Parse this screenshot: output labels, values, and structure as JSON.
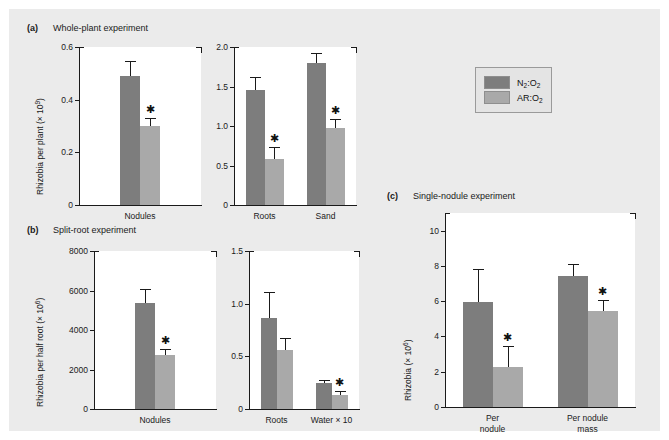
{
  "figure": {
    "background": "#ebebeb",
    "colors": {
      "dark": "#7d7d7d",
      "light": "#a9a9a9",
      "axis": "#1a1a1a"
    }
  },
  "legend": {
    "entries": [
      {
        "label_main": "N",
        "label_sub1": "2",
        "label_mid": ":O",
        "label_sub2": "2",
        "color": "#7d7d7d",
        "full": "N2:O2"
      },
      {
        "label_main": "AR",
        "label_sub1": "",
        "label_mid": ":O",
        "label_sub2": "2",
        "color": "#a9a9a9",
        "full": "AR:O2"
      }
    ]
  },
  "panels": [
    {
      "tag": "(a)",
      "title": "Whole-plant experiment",
      "ylabel_text": "Rhizobia per plant (× 10",
      "ylabel_exp": "9",
      "ylabel_close": ")"
    },
    {
      "tag": "(b)",
      "title": "Split-root experiment",
      "ylabel_text": "Rhizobia per half root (× 10",
      "ylabel_exp": "6",
      "ylabel_close": ")"
    },
    {
      "tag": "(c)",
      "title": "Single-nodule experiment",
      "ylabel_text": "Rhizobia (× 10",
      "ylabel_exp": "6",
      "ylabel_close": ")"
    }
  ],
  "chart_data": [
    {
      "id": "a-left",
      "type": "bar",
      "panel": "(a)",
      "title": "Whole-plant experiment",
      "ylabel": "Rhizobia per plant (× 10^9)",
      "xlabel": "",
      "ylim": [
        0,
        0.6
      ],
      "yticks": [
        0,
        0.2,
        0.4,
        0.6
      ],
      "yticklabels": [
        "0",
        "0.2",
        "0.4",
        "0.6"
      ],
      "grid": false,
      "categories": [
        "Nodules"
      ],
      "series": [
        {
          "name": "N2:O2",
          "color": "#7d7d7d",
          "values": [
            0.49
          ],
          "errors": [
            0.055
          ],
          "significant": [
            false
          ]
        },
        {
          "name": "AR:O2",
          "color": "#a9a9a9",
          "values": [
            0.3
          ],
          "errors": [
            0.032
          ],
          "significant": [
            true
          ]
        }
      ]
    },
    {
      "id": "a-right",
      "type": "bar",
      "panel": "(a)",
      "ylabel": "",
      "ylim": [
        0,
        2.0
      ],
      "yticks": [
        0,
        0.5,
        1.0,
        1.5,
        2.0
      ],
      "yticklabels": [
        "0",
        "0.5",
        "1.0",
        "1.5",
        "2.0"
      ],
      "grid": false,
      "categories": [
        "Roots",
        "Sand"
      ],
      "series": [
        {
          "name": "N2:O2",
          "color": "#7d7d7d",
          "values": [
            1.45,
            1.8
          ],
          "errors": [
            0.17,
            0.13
          ],
          "significant": [
            false,
            false
          ]
        },
        {
          "name": "AR:O2",
          "color": "#a9a9a9",
          "values": [
            0.58,
            0.97
          ],
          "errors": [
            0.15,
            0.12
          ],
          "significant": [
            true,
            true
          ]
        }
      ]
    },
    {
      "id": "b-left",
      "type": "bar",
      "panel": "(b)",
      "title": "Split-root experiment",
      "ylabel": "Rhizobia per half root (× 10^6)",
      "ylim": [
        0,
        8000
      ],
      "yticks": [
        0,
        2000,
        4000,
        6000,
        8000
      ],
      "yticklabels": [
        "0",
        "2000",
        "4000",
        "6000",
        "8000"
      ],
      "grid": false,
      "categories": [
        "Nodules"
      ],
      "series": [
        {
          "name": "N2:O2",
          "color": "#7d7d7d",
          "values": [
            5350
          ],
          "errors": [
            750
          ],
          "significant": [
            false
          ]
        },
        {
          "name": "AR:O2",
          "color": "#a9a9a9",
          "values": [
            2750
          ],
          "errors": [
            300
          ],
          "significant": [
            true
          ]
        }
      ]
    },
    {
      "id": "b-right",
      "type": "bar",
      "panel": "(b)",
      "ylabel": "",
      "ylim": [
        0,
        1.5
      ],
      "yticks": [
        0,
        0.5,
        1.0,
        1.5
      ],
      "yticklabels": [
        "0",
        "0.5",
        "1.0",
        "1.5"
      ],
      "grid": false,
      "categories": [
        "Roots",
        "Water × 10"
      ],
      "series": [
        {
          "name": "N2:O2",
          "color": "#7d7d7d",
          "values": [
            0.86,
            0.25
          ],
          "errors": [
            0.25,
            0.03
          ],
          "significant": [
            false,
            false
          ]
        },
        {
          "name": "AR:O2",
          "color": "#a9a9a9",
          "values": [
            0.56,
            0.13
          ],
          "errors": [
            0.11,
            0.04
          ],
          "significant": [
            false,
            true
          ]
        }
      ]
    },
    {
      "id": "c",
      "type": "bar",
      "panel": "(c)",
      "title": "Single-nodule experiment",
      "ylabel": "Rhizobia (× 10^6)",
      "ylim": [
        0,
        11
      ],
      "yticks": [
        0,
        2,
        4,
        6,
        8,
        10
      ],
      "yticklabels": [
        "0",
        "2",
        "4",
        "6",
        "8",
        "10"
      ],
      "grid": false,
      "categories": [
        "Per\nnodule",
        "Per nodule\nmass"
      ],
      "series": [
        {
          "name": "N2:O2",
          "color": "#7d7d7d",
          "values": [
            5.95,
            7.45
          ],
          "errors": [
            1.9,
            0.65
          ],
          "significant": [
            false,
            false
          ]
        },
        {
          "name": "AR:O2",
          "color": "#a9a9a9",
          "values": [
            2.25,
            5.45
          ],
          "errors": [
            1.2,
            0.6
          ],
          "significant": [
            true,
            true
          ]
        }
      ]
    }
  ]
}
